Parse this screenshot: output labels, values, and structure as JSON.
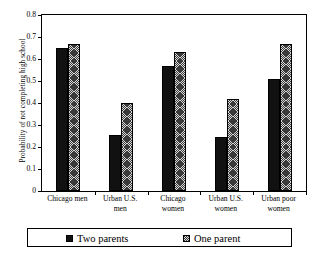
{
  "chart_data": {
    "type": "bar",
    "title": "",
    "subtitle": "",
    "xlabel": "",
    "ylabel": "Probability of not completing high school",
    "ylim": [
      0,
      0.8
    ],
    "ytick_labels": [
      "0.8",
      "0.7",
      "0.6",
      "0.5",
      "0.4",
      "0.3",
      "0.2",
      "0.1",
      "0"
    ],
    "ytick_values": [
      0.8,
      0.7,
      0.6,
      0.5,
      0.4,
      0.3,
      0.2,
      0.1,
      0
    ],
    "grid": false,
    "legend_position": "bottom",
    "categories": [
      "Chicago men",
      "Urban U.S. men",
      "Chicago women",
      "Urban U.S. women",
      "Urban poor women"
    ],
    "category_lines": [
      [
        "Chicago men"
      ],
      [
        "Urban U.S.",
        "men"
      ],
      [
        "Chicago",
        "women"
      ],
      [
        "Urban U.S.",
        "women"
      ],
      [
        "Urban poor",
        "women"
      ]
    ],
    "series": [
      {
        "name": "Two parents",
        "color": "#111111",
        "pattern": "solid",
        "values": [
          0.65,
          0.255,
          0.57,
          0.247,
          0.51
        ]
      },
      {
        "name": "One parent",
        "color": "#808080",
        "pattern": "checkerboard",
        "values": [
          0.667,
          0.4,
          0.63,
          0.42,
          0.667
        ]
      }
    ]
  },
  "legend": {
    "entries": [
      {
        "label": "Two parents"
      },
      {
        "label": "One parent"
      }
    ]
  }
}
